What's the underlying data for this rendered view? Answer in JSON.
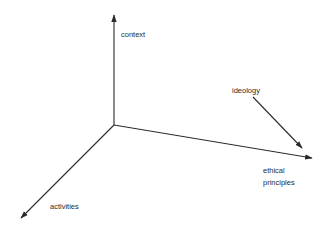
{
  "diagram": {
    "type": "3d-axes",
    "axes": [
      {
        "id": "context",
        "label_lines": [
          "context"
        ],
        "direction": "up"
      },
      {
        "id": "ethical-principles",
        "label_lines": [
          "ethical",
          "principles"
        ],
        "direction": "right"
      },
      {
        "id": "activities",
        "label_lines": [
          "activities"
        ],
        "direction": "down-left"
      }
    ],
    "annotation": {
      "id": "ideology",
      "label": "ideology",
      "points_to": "ethical-principles"
    },
    "colors": {
      "line": "#2b2b2b",
      "text": "#2a2a2a",
      "background": "#ffffff"
    }
  }
}
